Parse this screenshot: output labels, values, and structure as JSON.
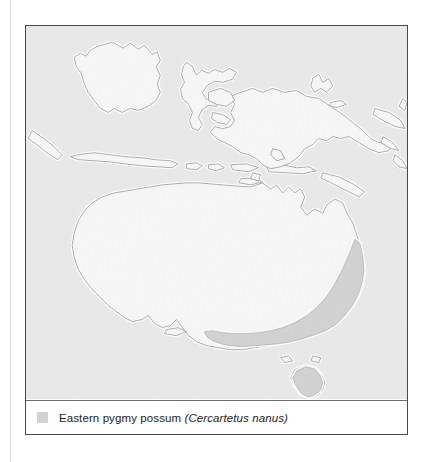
{
  "figure": {
    "kind": "species-distribution-map",
    "region_label": "Australia, New Guinea and Indonesian archipelago"
  },
  "legend": {
    "swatch_name": "range-swatch",
    "swatch_color": "#d2d2d2",
    "common_name": "Eastern pygmy possum",
    "scientific_name": "(Cercartetus nanus)"
  },
  "colors": {
    "ocean": "#e9e9e9",
    "land_fill": "#f7f7f7",
    "land_outline": "#9a9a9a",
    "coast_halo": "#ffffff",
    "range_fill": "#d2d2d2",
    "range_outline": "#b0b0b0",
    "frame": "#4a4a4a",
    "legend_divider": "#6f6f6f",
    "page_rule": "#dcdcdc",
    "text": "#1d1d1d"
  },
  "map_features": {
    "landmasses": [
      "Borneo",
      "Sulawesi",
      "Java",
      "Sumatra (eastern tip)",
      "Lesser Sunda Islands",
      "New Guinea",
      "Bismarck Archipelago",
      "Solomon Islands",
      "Australia",
      "Tasmania"
    ],
    "range_extent": [
      "southeast Queensland",
      "New South Wales coast",
      "Victoria",
      "southeast South Australia",
      "Tasmania"
    ]
  }
}
